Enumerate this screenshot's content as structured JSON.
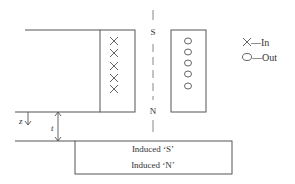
{
  "coil": {
    "left_symbols": [
      "×",
      "×",
      "×",
      "×",
      "×"
    ],
    "right_symbols": [
      "○",
      "○",
      "○",
      "○",
      "○"
    ]
  },
  "poles": {
    "top": "S",
    "bottom": "N"
  },
  "legend": [
    {
      "symbol": "×",
      "label": "—In"
    },
    {
      "symbol": "○",
      "label": "—Out"
    }
  ],
  "dimensions": {
    "z": "z",
    "t": "t"
  },
  "plate": {
    "top_label": "Induced ‘S’",
    "bottom_label": "Induced ‘N’"
  },
  "colors": {
    "stroke": "#555555",
    "text": "#333333"
  }
}
